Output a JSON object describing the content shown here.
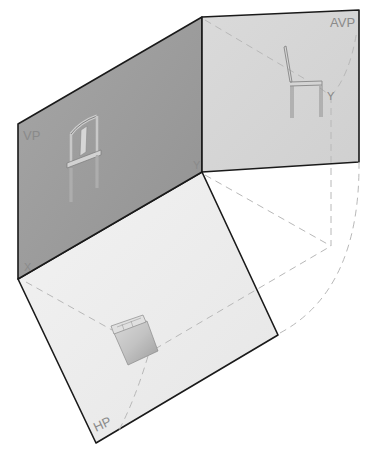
{
  "diagram": {
    "planes": [
      {
        "id": "vp",
        "label": "VP",
        "name": "Vertical Plane",
        "fill": "#9c9c9c"
      },
      {
        "id": "avp",
        "label": "AVP",
        "name": "Auxiliary Vertical Plane",
        "fill": "#d6d6d6"
      },
      {
        "id": "hp",
        "label": "HP",
        "name": "Horizontal Plane",
        "fill": "#ececec"
      }
    ],
    "axis_labels": {
      "x": "X",
      "y_vp": "Y",
      "y_avp": "Y"
    },
    "views": [
      {
        "plane": "vp",
        "content": "chair front view"
      },
      {
        "plane": "avp",
        "content": "chair side view"
      },
      {
        "plane": "hp",
        "content": "chair top view"
      }
    ],
    "colors": {
      "edge": "#1a1a1a",
      "projector_dash": "#b8b8b8",
      "label": "#8a8a8a",
      "background": "#ffffff"
    }
  }
}
